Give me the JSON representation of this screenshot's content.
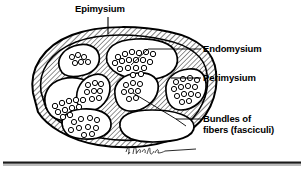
{
  "figure": {
    "signature": "K. Tanaka",
    "colors": {
      "ink": "#000000",
      "background": "#ffffff",
      "hatch": "#000000",
      "rule": "#1a1a1a"
    },
    "labels": {
      "epimysium": "Epimysium",
      "endomysium": "Endomysium",
      "perimysium": "Perimysium",
      "bundles_line1": "Bundles of",
      "bundles_line2": "fibers (fasciculi)"
    },
    "structures": [
      {
        "name": "Epimysium",
        "description": "outer hatched connective tissue sheath surrounding whole muscle"
      },
      {
        "name": "Endomysium",
        "description": "thin connective tissue around individual muscle fibers"
      },
      {
        "name": "Perimysium",
        "description": "hatched connective tissue septa dividing fascicles"
      },
      {
        "name": "Bundles of fibers (fasciculi)",
        "description": "grouped muscle fibers shown as clusters of small circles"
      }
    ],
    "fascicle_count": 8
  }
}
